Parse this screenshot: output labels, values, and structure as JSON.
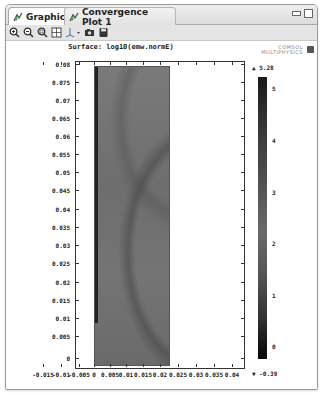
{
  "window": {
    "tabs": [
      {
        "label": "Graphics",
        "icon": "graphics-icon",
        "active": true
      },
      {
        "label": "Convergence Plot 1",
        "icon": "graphics-icon",
        "active": false
      }
    ],
    "controls": [
      "minimize-icon",
      "maximize-icon"
    ]
  },
  "toolbar": {
    "buttons": [
      "zoom-in-icon",
      "zoom-out-icon",
      "zoom-box-icon",
      "zoom-extents-icon",
      "axis-orientation-icon",
      "camera-icon",
      "save-image-icon"
    ]
  },
  "plot": {
    "title": "Surface: log10(emw.normE)",
    "logo_line1": "COMSOL",
    "logo_line2": "MULTIPHYSICS"
  },
  "chart_data": {
    "type": "heatmap",
    "title": "Surface: log10(emw.normE)",
    "xlabel": "",
    "ylabel": "",
    "x_ticks": [
      "-0.015",
      "-0.01",
      "-0.005",
      "0",
      "0.005",
      "0.01",
      "0.015",
      "0.02",
      "0.025",
      "0.03",
      "0.035",
      "0.04",
      "0.045"
    ],
    "y_ticks": [
      "0",
      "0.005",
      "0.01",
      "0.015",
      "0.02",
      "0.025",
      "0.03",
      "0.035",
      "0.04",
      "0.045",
      "0.05",
      "0.055",
      "0.06",
      "0.065",
      "0.07",
      "0.075",
      "0.08"
    ],
    "xlim": [
      -0.017,
      0.047
    ],
    "ylim": [
      -0.001,
      0.081
    ],
    "domain_x": [
      0,
      0.03
    ],
    "domain_y": [
      0,
      0.08
    ],
    "colorbar": {
      "max_label": "5.28",
      "min_label": "-0.39",
      "ticks": [
        "5",
        "4",
        "3",
        "2",
        "1",
        "0"
      ],
      "range": [
        -0.39,
        5.28
      ]
    }
  }
}
